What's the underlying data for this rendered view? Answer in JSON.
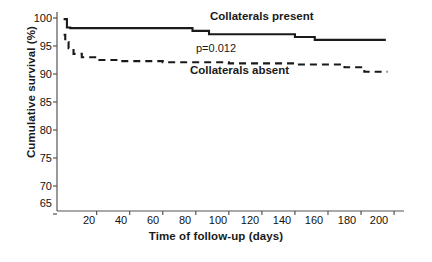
{
  "chart_data": {
    "type": "line",
    "title": "",
    "xlabel": "Time of follow-up (days)",
    "ylabel": "Cumulative survival (%)",
    "xlim": [
      0,
      200
    ],
    "ylim": [
      63,
      100
    ],
    "xticks": [
      20,
      40,
      60,
      80,
      100,
      120,
      140,
      160,
      180,
      200
    ],
    "yticks": [
      65,
      70,
      75,
      80,
      85,
      90,
      95,
      100
    ],
    "grid": false,
    "legend_position": "in-plot-annotations",
    "annotations": [
      {
        "name": "p-value",
        "text": "p=0.012",
        "x": 88,
        "y": 93.3
      },
      {
        "name": "curve-label-present",
        "text": "Collaterals present",
        "x": 112,
        "y": 99.6
      },
      {
        "name": "curve-label-absent",
        "text": "Collaterals absent",
        "x": 104,
        "y": 90.2
      }
    ],
    "series": [
      {
        "name": "Collaterals present",
        "label": "Collaterals present",
        "style": "solid",
        "color": "#1a1a1a",
        "steps": [
          [
            0,
            99.8
          ],
          [
            2,
            99.8
          ],
          [
            2,
            98.3
          ],
          [
            4,
            98.3
          ],
          [
            4,
            98.2
          ],
          [
            78,
            98.2
          ],
          [
            78,
            97.7
          ],
          [
            88,
            97.7
          ],
          [
            88,
            97.1
          ],
          [
            140,
            97.1
          ],
          [
            140,
            96.6
          ],
          [
            152,
            96.6
          ],
          [
            152,
            96.1
          ],
          [
            195,
            96.1
          ]
        ]
      },
      {
        "name": "Collaterals absent",
        "label": "Collaterals absent",
        "style": "dashed",
        "color": "#1a1a1a",
        "steps": [
          [
            0,
            97.0
          ],
          [
            1,
            97.0
          ],
          [
            1,
            95.7
          ],
          [
            3,
            95.7
          ],
          [
            3,
            94.6
          ],
          [
            6,
            94.6
          ],
          [
            6,
            93.6
          ],
          [
            11,
            93.6
          ],
          [
            11,
            93.0
          ],
          [
            20,
            93.0
          ],
          [
            20,
            92.5
          ],
          [
            34,
            92.5
          ],
          [
            34,
            92.3
          ],
          [
            60,
            92.3
          ],
          [
            60,
            92.1
          ],
          [
            100,
            92.1
          ],
          [
            100,
            91.9
          ],
          [
            140,
            91.9
          ],
          [
            140,
            91.7
          ],
          [
            170,
            91.7
          ],
          [
            170,
            91.2
          ],
          [
            182,
            91.2
          ],
          [
            182,
            90.4
          ],
          [
            196,
            90.4
          ]
        ]
      }
    ]
  },
  "axis": {
    "ytick_labels": [
      "100",
      "95",
      "90",
      "85",
      "80",
      "75",
      "70",
      "65"
    ],
    "xtick_labels": [
      "20",
      "40",
      "60",
      "80",
      "100",
      "120",
      "140",
      "160",
      "180",
      "200"
    ]
  }
}
